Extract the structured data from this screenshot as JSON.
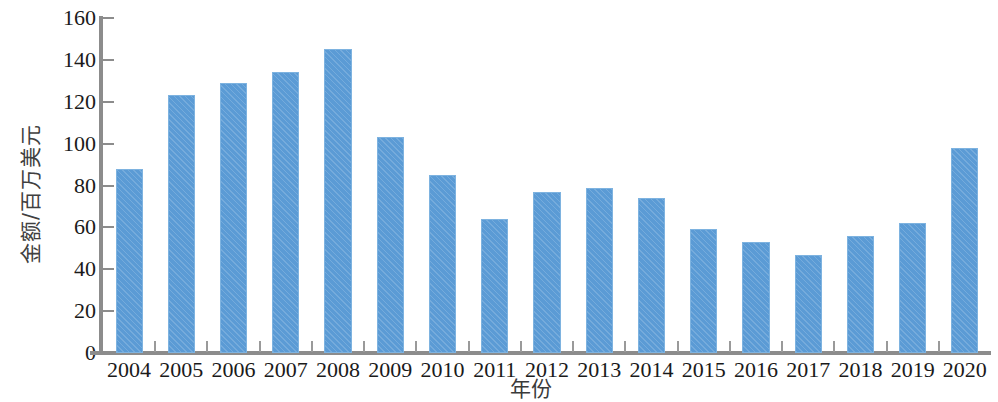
{
  "chart_data": {
    "type": "bar",
    "title": "",
    "subtitle": "",
    "xlabel": "年份",
    "ylabel": "金额/百万美元",
    "categories": [
      "2004",
      "2005",
      "2006",
      "2007",
      "2008",
      "2009",
      "2010",
      "2011",
      "2012",
      "2013",
      "2014",
      "2015",
      "2016",
      "2017",
      "2018",
      "2019",
      "2020"
    ],
    "values": [
      88,
      123,
      129,
      134,
      145,
      103,
      85,
      64,
      77,
      79,
      74,
      59,
      53,
      47,
      56,
      62,
      98
    ],
    "series": [
      {
        "name": "金额",
        "values": [
          88,
          123,
          129,
          134,
          145,
          103,
          85,
          64,
          77,
          79,
          74,
          59,
          53,
          47,
          56,
          62,
          98
        ]
      }
    ],
    "ylim": [
      0,
      160
    ],
    "yticks": [
      0,
      20,
      40,
      60,
      80,
      100,
      120,
      140,
      160
    ],
    "ytick_labels": [
      "0",
      "20",
      "40",
      "60",
      "80",
      "100",
      "120",
      "140",
      "160"
    ],
    "xtick_labels": [
      "2004",
      "2005",
      "2006",
      "2007",
      "2008",
      "2009",
      "2010",
      "2011",
      "2012",
      "2013",
      "2014",
      "2015",
      "2016",
      "2017",
      "2018",
      "2019",
      "2020"
    ],
    "grid": false,
    "legend": false,
    "legend_position": "none",
    "bar_color": "#5b9bd5",
    "bar_edge_color": "#7eb3e0",
    "axis_color": "#8c8c8c",
    "text_color": "#1a1a1a",
    "background_color": "#ffffff",
    "annotations": []
  }
}
